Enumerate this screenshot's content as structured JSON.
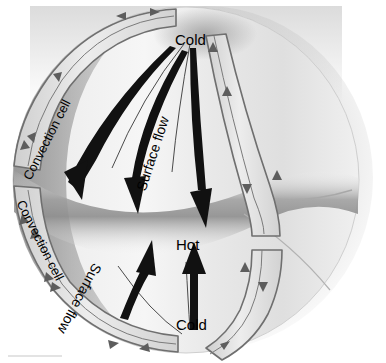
{
  "figure": {
    "kind": "convection-cell-sphere-diagram",
    "background_color": "#ffffff",
    "sphere": {
      "center_x": 193,
      "center_y": 181,
      "radius_x": 176,
      "radius_y": 176,
      "light_color": "#f2f2f2",
      "mid_color": "#c9c9c9",
      "shadow_color": "#8f8f8f",
      "halo_color": "#ebebeb",
      "equator_band_color": "#9a9a9a"
    },
    "outline_color": "#6a6a6a",
    "cell_fill_color": "#d8d8d8",
    "arrow_color": "#111111"
  },
  "labels": {
    "cold_top": "Cold",
    "hot_equator": "Hot",
    "cold_bottom": "Cold",
    "surface_flow_upper": "Surface flow",
    "surface_flow_lower": "Surface flow",
    "convection_cell_upper_left": "Convection cell",
    "convection_cell_lower_left": "Convection cell"
  },
  "annotations": {
    "thermal_poles": [
      "Cold",
      "Hot",
      "Cold"
    ],
    "flow_names": [
      "Surface flow",
      "Surface flow"
    ],
    "cell_names": [
      "Convection cell",
      "Convection cell"
    ]
  }
}
